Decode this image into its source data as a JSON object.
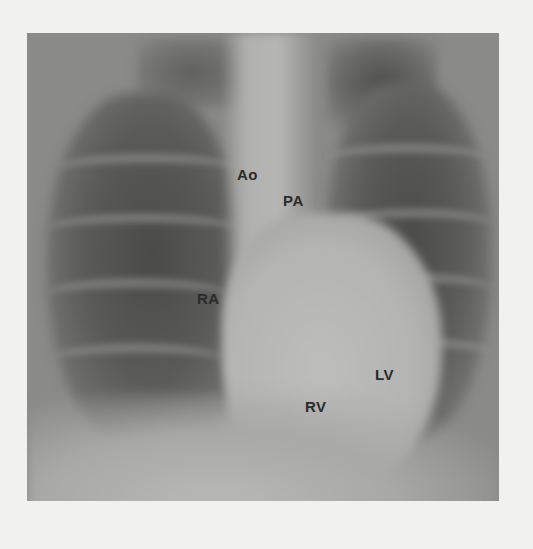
{
  "image": {
    "description": "Frontal chest X-ray with labeled cardiac structures",
    "background_color": "#f1f1ef",
    "film_color": "#8a8a88"
  },
  "labels": [
    {
      "id": "ao",
      "text": "Ao",
      "meaning": "Aorta",
      "x": 237,
      "y": 166
    },
    {
      "id": "pa",
      "text": "PA",
      "meaning": "Pulmonary artery",
      "x": 283,
      "y": 192
    },
    {
      "id": "ra",
      "text": "RA",
      "meaning": "Right atrium",
      "x": 197,
      "y": 290
    },
    {
      "id": "lv",
      "text": "LV",
      "meaning": "Left ventricle",
      "x": 375,
      "y": 366
    },
    {
      "id": "rv",
      "text": "RV",
      "meaning": "Right ventricle",
      "x": 305,
      "y": 398
    }
  ]
}
